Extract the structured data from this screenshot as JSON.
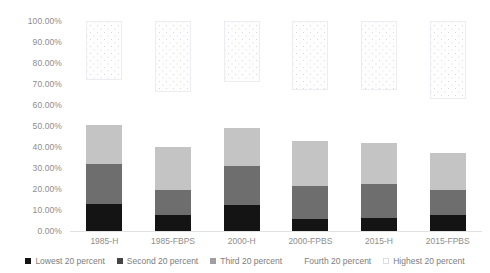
{
  "chart_data": {
    "type": "bar",
    "stacked": true,
    "title": "",
    "xlabel": "",
    "ylabel": "",
    "ylim": [
      0,
      100
    ],
    "ytick_format": "percent",
    "grid": false,
    "legend_position": "bottom",
    "categories": [
      "1985-H",
      "1985-FBPS",
      "2000-H",
      "2000-FPBS",
      "2015-H",
      "2015-FPBS"
    ],
    "ytick_labels": [
      "100.00%",
      "90.00%",
      "80.00%",
      "70.00%",
      "60.00%",
      "50.00%",
      "40.00%",
      "30.00%",
      "20.00%",
      "10.00%",
      "0.00%"
    ],
    "ytick_values": [
      100,
      90,
      80,
      70,
      60,
      50,
      40,
      30,
      20,
      10,
      0
    ],
    "series": [
      {
        "name": "Lowest 20 percent",
        "color": "#141414",
        "values": [
          13.0,
          7.7,
          12.5,
          5.8,
          6.3,
          7.7
        ]
      },
      {
        "name": "Second 20 percent",
        "color": "#6e6e6e",
        "values": [
          19.0,
          12.0,
          18.5,
          15.8,
          16.3,
          12.0
        ]
      },
      {
        "name": "Third 20 percent",
        "color": "#c4c4c4",
        "values": [
          18.5,
          20.3,
          18.0,
          21.4,
          19.4,
          17.3
        ]
      },
      {
        "name": "Fourth 20 percent",
        "color": "#ffffff",
        "values": [
          21.5,
          26.0,
          22.0,
          24.0,
          25.0,
          26.0
        ]
      },
      {
        "name": "Highest 20 percent",
        "color": "#fefefe",
        "values": [
          28.0,
          34.0,
          29.0,
          33.0,
          33.0,
          37.0
        ]
      }
    ]
  },
  "legend": {
    "items": [
      {
        "label": "Lowest 20 percent",
        "swatch": "legend-swatch-lowest"
      },
      {
        "label": "Second 20 percent",
        "swatch": "legend-swatch-second"
      },
      {
        "label": "Third 20 percent",
        "swatch": "legend-swatch-third"
      },
      {
        "label": "Fourth 20 percent",
        "swatch": "legend-swatch-fourth"
      },
      {
        "label": "Highest 20 percent",
        "swatch": "legend-swatch-highest"
      }
    ]
  }
}
